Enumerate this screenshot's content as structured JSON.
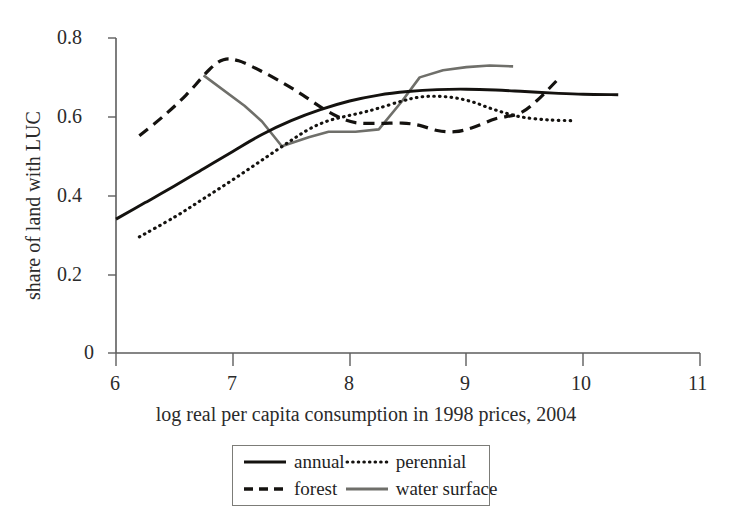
{
  "chart_data": {
    "type": "line",
    "title": "",
    "xlabel": "log real per capita consumption in 1998 prices, 2004",
    "ylabel": "share of land with LUC",
    "xlim": [
      6,
      11
    ],
    "ylim": [
      0,
      0.8
    ],
    "xticks": [
      "6",
      "7",
      "8",
      "9",
      "10",
      "11"
    ],
    "yticks": [
      "0",
      "0.2",
      "0.4",
      "0.6",
      "0.8"
    ],
    "grid": false,
    "legend_position": "below-axis-center",
    "series": [
      {
        "name": "annual",
        "style": "solid",
        "color": "#14120f",
        "points": [
          [
            6.0,
            0.34
          ],
          [
            6.25,
            0.382
          ],
          [
            6.5,
            0.424
          ],
          [
            6.75,
            0.468
          ],
          [
            7.0,
            0.512
          ],
          [
            7.25,
            0.555
          ],
          [
            7.5,
            0.59
          ],
          [
            7.75,
            0.618
          ],
          [
            8.0,
            0.64
          ],
          [
            8.25,
            0.655
          ],
          [
            8.5,
            0.664
          ],
          [
            8.75,
            0.669
          ],
          [
            9.0,
            0.67
          ],
          [
            9.25,
            0.668
          ],
          [
            9.5,
            0.664
          ],
          [
            9.75,
            0.66
          ],
          [
            10.0,
            0.657
          ],
          [
            10.3,
            0.656
          ]
        ]
      },
      {
        "name": "perennial",
        "style": "dotted",
        "color": "#14120f",
        "points": [
          [
            6.2,
            0.295
          ],
          [
            6.5,
            0.345
          ],
          [
            6.75,
            0.392
          ],
          [
            7.0,
            0.44
          ],
          [
            7.25,
            0.49
          ],
          [
            7.5,
            0.54
          ],
          [
            7.65,
            0.568
          ],
          [
            7.8,
            0.588
          ],
          [
            7.95,
            0.6
          ],
          [
            8.1,
            0.61
          ],
          [
            8.25,
            0.622
          ],
          [
            8.45,
            0.64
          ],
          [
            8.6,
            0.65
          ],
          [
            8.75,
            0.652
          ],
          [
            8.9,
            0.648
          ],
          [
            9.05,
            0.638
          ],
          [
            9.2,
            0.622
          ],
          [
            9.35,
            0.608
          ],
          [
            9.5,
            0.598
          ],
          [
            9.7,
            0.592
          ],
          [
            9.9,
            0.59
          ]
        ]
      },
      {
        "name": "forest",
        "style": "dashed",
        "color": "#14120f",
        "points": [
          [
            6.2,
            0.552
          ],
          [
            6.4,
            0.6
          ],
          [
            6.6,
            0.655
          ],
          [
            6.8,
            0.72
          ],
          [
            6.92,
            0.745
          ],
          [
            7.05,
            0.742
          ],
          [
            7.25,
            0.715
          ],
          [
            7.45,
            0.682
          ],
          [
            7.6,
            0.655
          ],
          [
            7.75,
            0.625
          ],
          [
            7.9,
            0.6
          ],
          [
            8.05,
            0.585
          ],
          [
            8.25,
            0.583
          ],
          [
            8.45,
            0.584
          ],
          [
            8.6,
            0.578
          ],
          [
            8.75,
            0.565
          ],
          [
            8.9,
            0.562
          ],
          [
            9.05,
            0.572
          ],
          [
            9.25,
            0.595
          ],
          [
            9.45,
            0.608
          ],
          [
            9.6,
            0.64
          ],
          [
            9.8,
            0.7
          ]
        ]
      },
      {
        "name": "water surface",
        "style": "solid-gray",
        "color": "#6f6f6a",
        "points": [
          [
            6.75,
            0.705
          ],
          [
            7.1,
            0.628
          ],
          [
            7.25,
            0.588
          ],
          [
            7.42,
            0.525
          ],
          [
            7.65,
            0.548
          ],
          [
            7.82,
            0.562
          ],
          [
            8.05,
            0.562
          ],
          [
            8.25,
            0.568
          ],
          [
            8.45,
            0.64
          ],
          [
            8.6,
            0.7
          ],
          [
            8.8,
            0.718
          ],
          [
            9.0,
            0.726
          ],
          [
            9.2,
            0.73
          ],
          [
            9.4,
            0.728
          ]
        ]
      }
    ]
  },
  "axes": {
    "y_tick_labels": [
      "0.8",
      "0.6",
      "0.4",
      "0.2",
      "0"
    ],
    "x_tick_labels": [
      "6",
      "7",
      "8",
      "9",
      "10",
      "11"
    ],
    "y_axis_title": "share of land with LUC",
    "x_axis_title": "log real per capita consumption in 1998 prices, 2004"
  },
  "legend": {
    "entries": [
      {
        "label": "annual",
        "swatch": "solid-line-swatch"
      },
      {
        "label": "perennial",
        "swatch": "dotted-line-swatch"
      },
      {
        "label": "forest",
        "swatch": "dashed-line-swatch"
      },
      {
        "label": "water surface",
        "swatch": "gray-line-swatch"
      }
    ]
  },
  "artifacts": {
    "top_scan_fragment": ""
  }
}
